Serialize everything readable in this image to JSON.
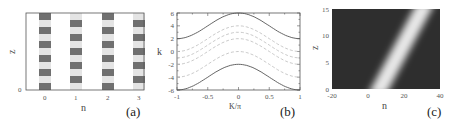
{
  "chart_data": [
    {
      "id": "a",
      "type": "heatmap",
      "panel_label": "(a)",
      "xlabel": "n",
      "ylabel": "z",
      "x_ticks": [
        "0",
        "1",
        "2",
        "3"
      ],
      "y_ticks": [
        "0"
      ],
      "stripes": [
        {
          "n": 0,
          "first_block": "dark"
        },
        {
          "n": 1,
          "first_block": "light"
        },
        {
          "n": 2,
          "first_block": "dark"
        },
        {
          "n": 3,
          "first_block": "light"
        }
      ],
      "blocks_per_stripe": 11,
      "colors": {
        "dark": "#707070",
        "light": "#e4e4e4",
        "frame": "#555555"
      }
    },
    {
      "id": "b",
      "type": "line",
      "panel_label": "(b)",
      "xlabel": "K/π",
      "ylabel": "k",
      "xlim": [
        -1,
        1
      ],
      "ylim": [
        -6,
        6
      ],
      "x_ticks": [
        "-1",
        "-0.5",
        "0",
        "0.5",
        "1"
      ],
      "y_ticks": [
        "6",
        "4",
        "2",
        "0",
        "-2",
        "-4",
        "-6"
      ],
      "series": [
        {
          "name": "upper band edge",
          "style": "solid",
          "formula": "4 + 2cos(πK)",
          "x": [
            -1,
            -0.5,
            0,
            0.5,
            1
          ],
          "values": [
            2,
            4,
            6,
            4,
            2
          ]
        },
        {
          "name": "dashed 1",
          "style": "dashed",
          "formula": "2 + 2cos(πK)",
          "x": [
            -1,
            -0.5,
            0,
            0.5,
            1
          ],
          "values": [
            0,
            2,
            4,
            2,
            0
          ]
        },
        {
          "name": "dashed 2",
          "style": "dashed",
          "formula": "1 + 2cos(πK)",
          "x": [
            -1,
            -0.5,
            0,
            0.5,
            1
          ],
          "values": [
            -1,
            1,
            3,
            1,
            -1
          ]
        },
        {
          "name": "dashed 3",
          "style": "dashed",
          "formula": "0 + 2cos(πK)",
          "x": [
            -1,
            -0.5,
            0,
            0.5,
            1
          ],
          "values": [
            -2,
            0,
            2,
            0,
            -2
          ]
        },
        {
          "name": "dashed 4",
          "style": "dashed",
          "formula": "-2 + 2cos(πK)",
          "x": [
            -1,
            -0.5,
            0,
            0.5,
            1
          ],
          "values": [
            -4,
            -2,
            0,
            -2,
            -4
          ]
        },
        {
          "name": "lower band edge",
          "style": "solid",
          "formula": "-4 + 2cos(πK)",
          "x": [
            -1,
            -0.5,
            0,
            0.5,
            1
          ],
          "values": [
            -6,
            -4,
            -2,
            -4,
            -6
          ]
        }
      ],
      "offsets": [
        4,
        2,
        1,
        0,
        -2,
        -4
      ],
      "amplitude": 2
    },
    {
      "id": "c",
      "type": "heatmap",
      "panel_label": "(c)",
      "xlabel": "n",
      "ylabel": "z",
      "xlim": [
        -20,
        40
      ],
      "ylim": [
        0,
        15
      ],
      "x_ticks": [
        "-20",
        "0",
        "20",
        "40"
      ],
      "y_ticks": [
        "0",
        "5",
        "10",
        "15"
      ],
      "beam": {
        "n_at_z0": 5,
        "n_at_z15": 32,
        "width_n": 6
      },
      "colors": {
        "background": "#2e2e2e",
        "peak": "#f2f2f2"
      }
    }
  ]
}
